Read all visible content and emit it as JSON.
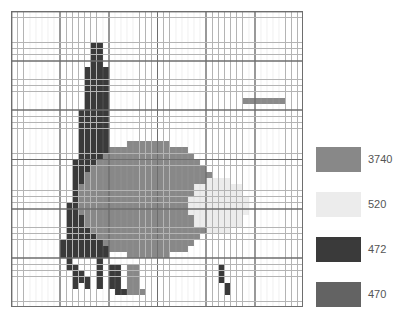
{
  "figure": {
    "type": "raster-grid-with-legend",
    "background_color": "#ffffff",
    "width": 402,
    "height": 320
  },
  "grid": {
    "name": "pixel-raster-grid",
    "cols": 48,
    "rows": 48,
    "cell_width": 6.083,
    "cell_height": 6.166,
    "left": 11,
    "top": 11,
    "width": 292,
    "height": 296,
    "minor_gridline_color": "#b4b4b4",
    "major_gridline_color": "#6e6e6e",
    "major_every": 8,
    "border_color": "#6e6e6e",
    "empty_cell_color": "#ffffff"
  },
  "palette": {
    "value_3740": "#888888",
    "value_520": "#ececec",
    "value_472": "#3a3a3a",
    "value_470": "#636363",
    "faint_line": "#8a8a8a"
  },
  "legend": {
    "name": "raster-value-legend",
    "items": [
      {
        "label": "3740",
        "color": "#888888"
      },
      {
        "label": "520",
        "color": "#ececec"
      },
      {
        "label": "472",
        "color": "#3a3a3a"
      },
      {
        "label": "470",
        "color": "#636363"
      }
    ],
    "label_color": "#555555",
    "swatch_width": 45,
    "swatch_height": 25,
    "row_spacing": 45
  },
  "chart_data": {
    "type": "heatmap",
    "title": "",
    "xlabel": "",
    "ylabel": "",
    "grid": true,
    "legend_position": "right",
    "categories": [
      "3740",
      "520",
      "472",
      "470"
    ],
    "values": [
      3740,
      520,
      472,
      470
    ],
    "colors": [
      "#888888",
      "#ececec",
      "#3a3a3a",
      "#636363"
    ],
    "nx": 48,
    "ny": 48,
    "regions": [
      {
        "value": 472,
        "color": "#3a3a3a",
        "name": "conifer-spire-and-trunks",
        "rects": [
          [
            13,
            5,
            2,
            4
          ],
          [
            12,
            9,
            4,
            4
          ],
          [
            12,
            13,
            4,
            3
          ],
          [
            11,
            16,
            5,
            4
          ],
          [
            11,
            20,
            5,
            4
          ],
          [
            10,
            24,
            6,
            4
          ],
          [
            10,
            28,
            6,
            3
          ],
          [
            9,
            31,
            7,
            3
          ],
          [
            9,
            34,
            7,
            3
          ],
          [
            8,
            37,
            8,
            3
          ],
          [
            19,
            21,
            2,
            1
          ],
          [
            9,
            40,
            1,
            2
          ],
          [
            10,
            41,
            1,
            2
          ],
          [
            11,
            42,
            1,
            2
          ],
          [
            10,
            43,
            1,
            2
          ],
          [
            12,
            43,
            1,
            2
          ],
          [
            14,
            40,
            1,
            5
          ],
          [
            16,
            41,
            2,
            4
          ],
          [
            17,
            45,
            2,
            1
          ],
          [
            34,
            41,
            1,
            3
          ],
          [
            35,
            44,
            1,
            2
          ]
        ]
      },
      {
        "value": 3740,
        "color": "#888888",
        "name": "main-canopy",
        "ellipse": {
          "cx": 22.5,
          "cy": 30.5,
          "rx": 11.5,
          "ry": 9.5
        },
        "extra_rects": [
          [
            19,
            41,
            2,
            5
          ],
          [
            20,
            45,
            2,
            1
          ]
        ]
      },
      {
        "value": 520,
        "color": "#ececec",
        "name": "secondary-canopy",
        "ellipse": {
          "cx": 34.0,
          "cy": 31.5,
          "rx": 5.0,
          "ry": 4.5
        }
      },
      {
        "value": 470,
        "color": "#8a8a8a",
        "name": "faint-horizontal-marker",
        "rects": [
          [
            38,
            14,
            7,
            1
          ]
        ]
      }
    ]
  }
}
